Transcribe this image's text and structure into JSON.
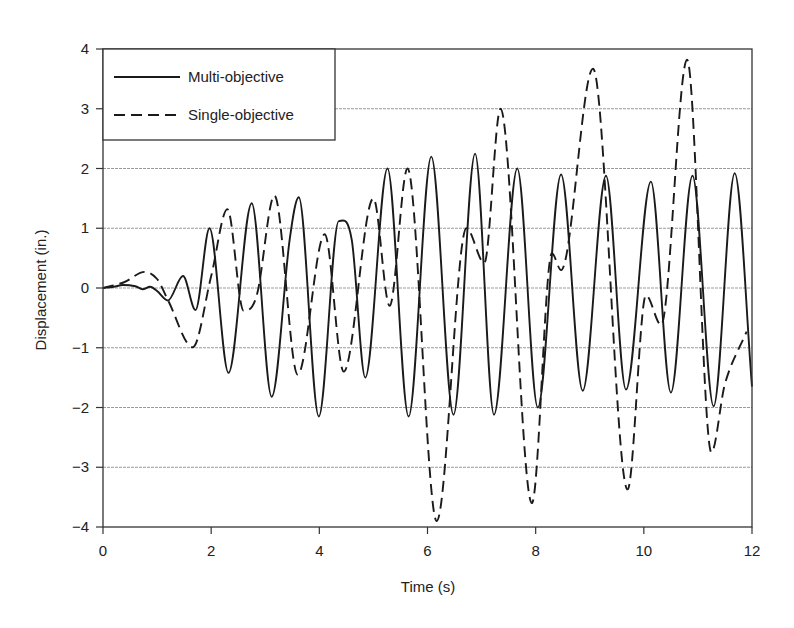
{
  "chart_data": {
    "type": "line",
    "title": "",
    "xlabel": "Time (s)",
    "ylabel": "Displacement (in.)",
    "xlim": [
      0,
      12
    ],
    "ylim": [
      -4,
      4
    ],
    "xticks": [
      0,
      2,
      4,
      6,
      8,
      10,
      12
    ],
    "yticks": [
      4,
      3,
      2,
      1,
      0,
      -1,
      -2,
      -3,
      -4
    ],
    "grid": "horizontal",
    "legend_position": "upper left",
    "series": [
      {
        "name": "Multi-objective",
        "style": "solid",
        "color": "#1a1a1a",
        "points": [
          [
            0,
            0
          ],
          [
            0.2,
            0.02
          ],
          [
            0.37,
            0.05
          ],
          [
            0.6,
            0.03
          ],
          [
            0.73,
            -0.02
          ],
          [
            0.87,
            0.02
          ],
          [
            1.0,
            -0.05
          ],
          [
            1.2,
            -0.21
          ],
          [
            1.48,
            0.2
          ],
          [
            1.71,
            -0.37
          ],
          [
            1.97,
            1.0
          ],
          [
            2.32,
            -1.42
          ],
          [
            2.75,
            1.42
          ],
          [
            3.12,
            -1.82
          ],
          [
            3.45,
            0.8
          ],
          [
            3.62,
            1.52
          ],
          [
            3.99,
            -2.15
          ],
          [
            4.36,
            1.12
          ],
          [
            4.6,
            0.8
          ],
          [
            4.85,
            -1.5
          ],
          [
            5.26,
            2.0
          ],
          [
            5.65,
            -2.15
          ],
          [
            6.07,
            2.2
          ],
          [
            6.48,
            -2.12
          ],
          [
            6.88,
            2.25
          ],
          [
            7.23,
            -2.12
          ],
          [
            7.66,
            2.0
          ],
          [
            8.04,
            -2.0
          ],
          [
            8.47,
            1.9
          ],
          [
            8.87,
            -1.72
          ],
          [
            9.3,
            1.88
          ],
          [
            9.67,
            -1.7
          ],
          [
            10.13,
            1.78
          ],
          [
            10.5,
            -1.75
          ],
          [
            10.9,
            1.88
          ],
          [
            11.29,
            -1.98
          ],
          [
            11.68,
            1.92
          ],
          [
            12.0,
            -1.65
          ]
        ]
      },
      {
        "name": "Single-objective",
        "style": "dashed",
        "color": "#1a1a1a",
        "points": [
          [
            0,
            0
          ],
          [
            0.4,
            0.1
          ],
          [
            0.77,
            0.27
          ],
          [
            1.0,
            0.15
          ],
          [
            1.2,
            -0.2
          ],
          [
            1.66,
            -0.99
          ],
          [
            2.0,
            0.2
          ],
          [
            2.3,
            1.32
          ],
          [
            2.6,
            -0.38
          ],
          [
            2.85,
            -0.1
          ],
          [
            3.17,
            1.55
          ],
          [
            3.6,
            -1.45
          ],
          [
            4.1,
            0.9
          ],
          [
            4.45,
            -1.4
          ],
          [
            5.0,
            1.5
          ],
          [
            5.3,
            -0.3
          ],
          [
            5.63,
            2.0
          ],
          [
            6.17,
            -3.9
          ],
          [
            6.72,
            1.0
          ],
          [
            7.05,
            0.42
          ],
          [
            7.35,
            3.0
          ],
          [
            7.93,
            -3.6
          ],
          [
            8.3,
            0.58
          ],
          [
            8.47,
            0.3
          ],
          [
            9.06,
            3.67
          ],
          [
            9.7,
            -3.37
          ],
          [
            10.04,
            -0.12
          ],
          [
            10.32,
            -0.62
          ],
          [
            10.8,
            3.82
          ],
          [
            11.25,
            -2.75
          ],
          [
            11.5,
            -1.6
          ],
          [
            11.9,
            -0.73
          ]
        ]
      }
    ]
  },
  "axes": {
    "xlabel": "Time (s)",
    "ylabel": "Displacement (in.)"
  },
  "legend": {
    "items": [
      {
        "label": "Multi-objective",
        "style": "solid"
      },
      {
        "label": "Single-objective",
        "style": "dashed"
      }
    ]
  },
  "colors": {
    "line": "#1a1a1a",
    "axis": "#333333",
    "grid": "#9a9a9a",
    "background": "#ffffff"
  }
}
